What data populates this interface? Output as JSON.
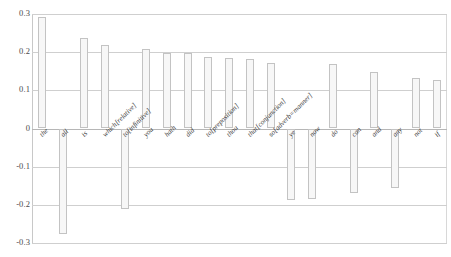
{
  "chart_data": {
    "type": "bar",
    "title": "",
    "subtitle": "",
    "xlabel": "",
    "ylabel": "",
    "ylim": [
      -0.3,
      0.3
    ],
    "grid": true,
    "legend": false,
    "legend_position": "none",
    "y_ticks": [
      "0.3",
      "0.2",
      "0.1",
      "0",
      "-0.1",
      "-0.2",
      "-0.3"
    ],
    "y_tick_values": [
      0.3,
      0.2,
      0.1,
      0,
      -0.1,
      -0.2,
      -0.3
    ],
    "bar_color": "#f7f7f7",
    "bar_border_color": "#c3c3c3",
    "grid_color": "#cfcfcf",
    "categories": [
      "the",
      "all",
      "is",
      "which[relative]",
      "to[infinitive]",
      "you",
      "hath",
      "did",
      "to[preposition]",
      "thou",
      "that[conjunction]",
      "so[adverb=manner]",
      "ye",
      "now",
      "do",
      "can",
      "and",
      "any",
      "not",
      "if"
    ],
    "values": [
      0.291,
      -0.277,
      0.237,
      0.22,
      -0.212,
      0.208,
      0.199,
      0.198,
      0.188,
      0.186,
      0.181,
      0.172,
      -0.188,
      -0.184,
      0.169,
      -0.168,
      0.147,
      -0.156,
      0.133,
      0.126
    ]
  }
}
